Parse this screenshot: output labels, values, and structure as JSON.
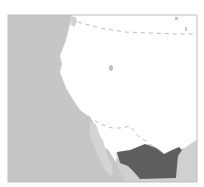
{
  "map": {
    "type": "locator-map",
    "colors": {
      "background": "#ffffff",
      "ocean": "#c4c4c4",
      "land": "#ffffff",
      "surrounding_land": "#cfcfcf",
      "highlight_region": "#606060",
      "border_line": "#b8b8b8",
      "frame": "#bdbdbd"
    },
    "regions": [
      {
        "name": "pacific-ocean",
        "role": "water"
      },
      {
        "name": "western-united-states",
        "role": "land"
      },
      {
        "name": "baja-california-peninsula",
        "role": "land"
      },
      {
        "name": "gulf-of-california",
        "role": "water"
      },
      {
        "name": "mexico-mainland",
        "role": "land"
      },
      {
        "name": "highlighted-region",
        "role": "highlight"
      }
    ],
    "borders": [
      {
        "name": "us-canada-border",
        "style": "dashed"
      },
      {
        "name": "us-mexico-border",
        "style": "dashed"
      }
    ]
  }
}
